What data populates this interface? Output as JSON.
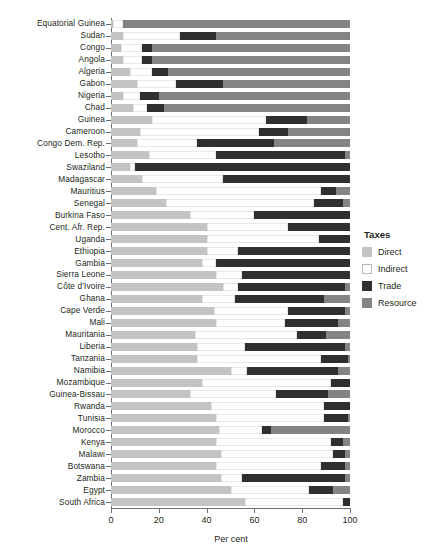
{
  "chart_data": {
    "type": "bar",
    "subtype": "stacked-horizontal-100",
    "title": "",
    "xlabel": "Per cent",
    "ylabel": "",
    "xlim": [
      0,
      100
    ],
    "xticks": [
      0,
      20,
      40,
      60,
      80,
      100
    ],
    "xticklabels": [
      "0",
      "20",
      "40",
      "60",
      "80",
      "100"
    ],
    "grid": false,
    "legend": {
      "title": "Taxes",
      "position": "right",
      "entries": [
        {
          "name": "Direct",
          "color": "#c3c3c3"
        },
        {
          "name": "Indirect",
          "color": "#ffffff"
        },
        {
          "name": "Trade",
          "color": "#2f2f2f"
        },
        {
          "name": "Resource",
          "color": "#848484"
        }
      ]
    },
    "series": [
      {
        "name": "Direct",
        "color": "#c3c3c3"
      },
      {
        "name": "Indirect",
        "color": "#ffffff"
      },
      {
        "name": "Trade",
        "color": "#2f2f2f"
      },
      {
        "name": "Resource",
        "color": "#848484"
      }
    ],
    "categories": [
      "Equatorial Guinea",
      "Sudan",
      "Congo",
      "Angola",
      "Algeria",
      "Gabon",
      "Nigeria",
      "Chad",
      "Guinea",
      "Cameroon",
      "Congo Dem. Rep.",
      "Lesotho",
      "Swaziland",
      "Madagascar",
      "Mauritius",
      "Senegal",
      "Burkina Faso",
      "Cent. Afr. Rep.",
      "Uganda",
      "Ethiopia",
      "Gambia",
      "Sierra Leone",
      "Côte d’Ivoire",
      "Ghana",
      "Cape Verde",
      "Mali",
      "Mauritania",
      "Liberia",
      "Tanzania",
      "Namibia",
      "Mozambique",
      "Guinea-Bissau",
      "Rwanda",
      "Tunisia",
      "Morocco",
      "Kenya",
      "Malawi",
      "Botswana",
      "Zambia",
      "Egypt",
      "South Africa"
    ],
    "rows": [
      {
        "category": "Equatorial Guinea",
        "direct": 1,
        "indirect": 4,
        "trade": 0,
        "resource": 95
      },
      {
        "category": "Sudan",
        "direct": 5,
        "indirect": 24,
        "trade": 15,
        "resource": 56
      },
      {
        "category": "Congo",
        "direct": 4,
        "indirect": 9,
        "trade": 4,
        "resource": 83
      },
      {
        "category": "Angola",
        "direct": 5,
        "indirect": 8,
        "trade": 4,
        "resource": 83
      },
      {
        "category": "Algeria",
        "direct": 8,
        "indirect": 9,
        "trade": 7,
        "resource": 76
      },
      {
        "category": "Gabon",
        "direct": 11,
        "indirect": 16,
        "trade": 20,
        "resource": 53
      },
      {
        "category": "Nigeria",
        "direct": 5,
        "indirect": 7,
        "trade": 8,
        "resource": 80
      },
      {
        "category": "Chad",
        "direct": 9,
        "indirect": 6,
        "trade": 7,
        "resource": 78
      },
      {
        "category": "Guinea",
        "direct": 17,
        "indirect": 48,
        "trade": 17,
        "resource": 18
      },
      {
        "category": "Cameroon",
        "direct": 12,
        "indirect": 50,
        "trade": 12,
        "resource": 26
      },
      {
        "category": "Congo Dem. Rep.",
        "direct": 11,
        "indirect": 25,
        "trade": 32,
        "resource": 32
      },
      {
        "category": "Lesotho",
        "direct": 16,
        "indirect": 28,
        "trade": 54,
        "resource": 2
      },
      {
        "category": "Swaziland",
        "direct": 8,
        "indirect": 2,
        "trade": 90,
        "resource": 0
      },
      {
        "category": "Madagascar",
        "direct": 13,
        "indirect": 34,
        "trade": 53,
        "resource": 0
      },
      {
        "category": "Mauritius",
        "direct": 19,
        "indirect": 69,
        "trade": 6,
        "resource": 6
      },
      {
        "category": "Senegal",
        "direct": 23,
        "indirect": 62,
        "trade": 12,
        "resource": 3
      },
      {
        "category": "Burkina Faso",
        "direct": 33,
        "indirect": 27,
        "trade": 40,
        "resource": 0
      },
      {
        "category": "Cent. Afr. Rep.",
        "direct": 40,
        "indirect": 34,
        "trade": 26,
        "resource": 0
      },
      {
        "category": "Uganda",
        "direct": 40,
        "indirect": 47,
        "trade": 13,
        "resource": 0
      },
      {
        "category": "Ethiopia",
        "direct": 40,
        "indirect": 13,
        "trade": 47,
        "resource": 0
      },
      {
        "category": "Gambia",
        "direct": 38,
        "indirect": 6,
        "trade": 56,
        "resource": 0
      },
      {
        "category": "Sierra Leone",
        "direct": 44,
        "indirect": 11,
        "trade": 45,
        "resource": 0
      },
      {
        "category": "Côte d’Ivoire",
        "direct": 47,
        "indirect": 6,
        "trade": 45,
        "resource": 2
      },
      {
        "category": "Ghana",
        "direct": 38,
        "indirect": 14,
        "trade": 37,
        "resource": 11
      },
      {
        "category": "Cape Verde",
        "direct": 43,
        "indirect": 31,
        "trade": 24,
        "resource": 2
      },
      {
        "category": "Mali",
        "direct": 44,
        "indirect": 29,
        "trade": 22,
        "resource": 5
      },
      {
        "category": "Mauritania",
        "direct": 35,
        "indirect": 43,
        "trade": 12,
        "resource": 10
      },
      {
        "category": "Liberia",
        "direct": 36,
        "indirect": 20,
        "trade": 42,
        "resource": 2
      },
      {
        "category": "Tanzania",
        "direct": 36,
        "indirect": 52,
        "trade": 11,
        "resource": 1
      },
      {
        "category": "Namibia",
        "direct": 50,
        "indirect": 7,
        "trade": 38,
        "resource": 5
      },
      {
        "category": "Mozambique",
        "direct": 38,
        "indirect": 54,
        "trade": 8,
        "resource": 0
      },
      {
        "category": "Guinea-Bissau",
        "direct": 33,
        "indirect": 36,
        "trade": 22,
        "resource": 9
      },
      {
        "category": "Rwanda",
        "direct": 42,
        "indirect": 47,
        "trade": 11,
        "resource": 0
      },
      {
        "category": "Tunisia",
        "direct": 44,
        "indirect": 45,
        "trade": 10,
        "resource": 1
      },
      {
        "category": "Morocco",
        "direct": 45,
        "indirect": 18,
        "trade": 4,
        "resource": 33
      },
      {
        "category": "Kenya",
        "direct": 44,
        "indirect": 48,
        "trade": 5,
        "resource": 3
      },
      {
        "category": "Malawi",
        "direct": 46,
        "indirect": 47,
        "trade": 5,
        "resource": 2
      },
      {
        "category": "Botswana",
        "direct": 44,
        "indirect": 44,
        "trade": 10,
        "resource": 2
      },
      {
        "category": "Zambia",
        "direct": 46,
        "indirect": 9,
        "trade": 43,
        "resource": 2
      },
      {
        "category": "Egypt",
        "direct": 50,
        "indirect": 33,
        "trade": 10,
        "resource": 7
      },
      {
        "category": "South Africa",
        "direct": 56,
        "indirect": 41,
        "trade": 3,
        "resource": 0
      }
    ]
  }
}
